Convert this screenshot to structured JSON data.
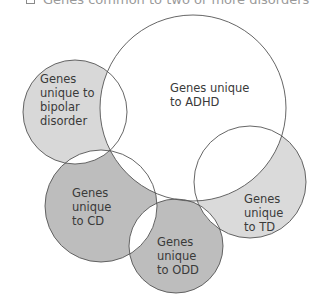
{
  "legend": {
    "items": [
      {
        "label": "Genes common to two or more disorders",
        "swatch": "#ffffff"
      }
    ]
  },
  "diagram": {
    "type": "venn",
    "sets": [
      {
        "id": "adhd",
        "label_lines": [
          "Genes unique",
          "to ADHD"
        ],
        "fill": "#ffffff",
        "cx": 193,
        "cy": 108,
        "r": 93
      },
      {
        "id": "bipolar",
        "label_lines": [
          "Genes",
          "unique to",
          "bipolar",
          "disorder"
        ],
        "fill": "#d8d8d8",
        "cx": 75,
        "cy": 112,
        "r": 52
      },
      {
        "id": "cd",
        "label_lines": [
          "Genes",
          "unique",
          "to CD"
        ],
        "fill": "#bdbdbd",
        "cx": 101,
        "cy": 206,
        "r": 56
      },
      {
        "id": "odd",
        "label_lines": [
          "Genes",
          "unique",
          "to ODD"
        ],
        "fill": "#bdbdbd",
        "cx": 176,
        "cy": 246,
        "r": 47
      },
      {
        "id": "td",
        "label_lines": [
          "Genes",
          "unique",
          "to TD"
        ],
        "fill": "#dadada",
        "cx": 250,
        "cy": 182,
        "r": 56
      }
    ],
    "overlap_fill": "#ffffff",
    "stroke": "#555555"
  }
}
